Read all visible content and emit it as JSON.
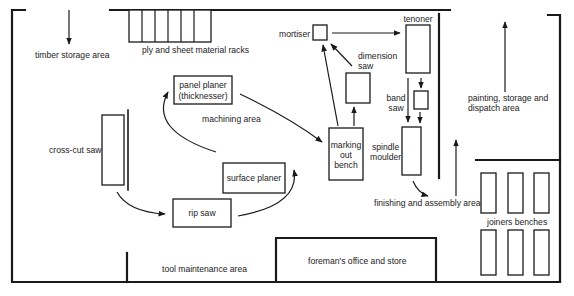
{
  "diagram": {
    "type": "workshop floor plan",
    "colors": {
      "line": "#1a1a1a",
      "text": "#222222",
      "background": "#ffffff"
    },
    "areas": {
      "timber_storage": "timber storage area",
      "ply_racks": "ply and sheet material racks",
      "machining": "machining area",
      "finishing_assembly": "finishing and assembly area",
      "painting_line1": "painting, storage and",
      "painting_line2": "dispatch area",
      "tool_maintenance": "tool maintenance area",
      "foreman_office": "foreman's office and store",
      "joiners_benches": "joiners benches"
    },
    "machines": {
      "cross_cut_saw": "cross-cut saw",
      "panel_planer_line1": "panel planer",
      "panel_planer_line2": "(thicknesser)",
      "surface_planer": "surface planer",
      "rip_saw": "rip saw",
      "marking_line1": "marking",
      "marking_line2": "out",
      "marking_line3": "bench",
      "mortiser": "mortiser",
      "dimension_saw_line1": "dimension",
      "dimension_saw_line2": "saw",
      "tenoner": "tenoner",
      "band_saw_line1": "band",
      "band_saw_line2": "saw",
      "spindle_line1": "spindle",
      "spindle_line2": "moulder"
    },
    "flow_sequence": [
      "timber storage area",
      "cross-cut saw",
      "rip saw",
      "surface planer",
      "panel planer (thicknesser)",
      "marking out bench",
      "mortiser",
      "dimension saw",
      "tenoner",
      "band saw",
      "spindle moulder",
      "finishing and assembly area",
      "painting, storage and dispatch area"
    ]
  }
}
